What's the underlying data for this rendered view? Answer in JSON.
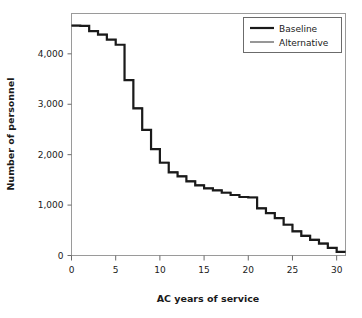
{
  "chart_data": {
    "type": "line",
    "subtype": "step-post",
    "title": "",
    "xlabel": "AC years of service",
    "ylabel": "Number of personnel",
    "xlim": [
      0,
      31
    ],
    "ylim": [
      0,
      4800
    ],
    "xticks": [
      0,
      5,
      10,
      15,
      20,
      25,
      30
    ],
    "xtick_labels": [
      "0",
      "5",
      "10",
      "15",
      "20",
      "25",
      "30"
    ],
    "yticks": [
      0,
      1000,
      2000,
      3000,
      4000
    ],
    "ytick_labels": [
      "0",
      "1,000",
      "2,000",
      "3,000",
      "4,000"
    ],
    "grid": false,
    "legend_position": "top-right",
    "x": [
      0,
      1,
      2,
      3,
      4,
      5,
      6,
      7,
      8,
      9,
      10,
      11,
      12,
      13,
      14,
      15,
      16,
      17,
      18,
      19,
      20,
      21,
      22,
      23,
      24,
      25,
      26,
      27,
      28,
      29,
      30
    ],
    "series": [
      {
        "name": "Baseline",
        "color": "#1a1a1a",
        "width": 2.2,
        "values": [
          4560,
          4555,
          4450,
          4380,
          4280,
          4180,
          3480,
          2920,
          2490,
          2110,
          1840,
          1650,
          1570,
          1470,
          1390,
          1330,
          1290,
          1245,
          1200,
          1160,
          1150,
          935,
          840,
          740,
          610,
          480,
          390,
          310,
          235,
          150,
          70
        ]
      },
      {
        "name": "Alternative",
        "color": "#6b6b6b",
        "width": 1.1,
        "values": [
          4565,
          4560,
          4455,
          4385,
          4285,
          4185,
          3490,
          2930,
          2500,
          2120,
          1850,
          1660,
          1580,
          1480,
          1400,
          1340,
          1300,
          1255,
          1210,
          1170,
          1160,
          945,
          850,
          750,
          620,
          490,
          400,
          320,
          245,
          160,
          80
        ]
      }
    ]
  },
  "legend": {
    "entries": [
      {
        "label": "Baseline"
      },
      {
        "label": "Alternative"
      }
    ]
  }
}
